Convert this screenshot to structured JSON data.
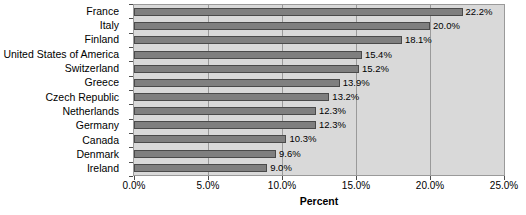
{
  "chart_data": {
    "type": "bar",
    "orientation": "horizontal",
    "title": "",
    "xlabel": "Percent",
    "ylabel": "",
    "xlim": [
      0,
      25
    ],
    "grid": true,
    "legend": false,
    "xticks": [
      "0.0%",
      "5.0%",
      "10.0%",
      "15.0%",
      "20.0%",
      "25.0%"
    ],
    "xtick_values": [
      0,
      5,
      10,
      15,
      20,
      25
    ],
    "categories": [
      "France",
      "Italy",
      "Finland",
      "United States of America",
      "Switzerland",
      "Greece",
      "Czech Republic",
      "Netherlands",
      "Germany",
      "Canada",
      "Denmark",
      "Ireland"
    ],
    "values": [
      22.2,
      20.0,
      18.1,
      15.4,
      15.2,
      13.9,
      13.2,
      12.3,
      12.3,
      10.3,
      9.6,
      9.0
    ],
    "data_labels": [
      "22.2%",
      "20.0%",
      "18.1%",
      "15.4%",
      "15.2%",
      "13.9%",
      "13.2%",
      "12.3%",
      "12.3%",
      "10.3%",
      "9.6%",
      "9.0%"
    ],
    "colors": {
      "bar_fill": "#7f7f7f",
      "bar_border": "#4a4a4a",
      "plot_background": "#d9d9d9",
      "gridline": "#9a9a9a",
      "text": "#000000",
      "page_background": "#ffffff"
    }
  }
}
